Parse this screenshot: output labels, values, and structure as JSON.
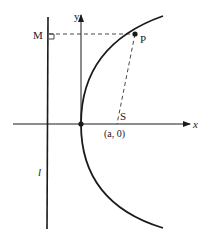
{
  "diagram": {
    "labels": {
      "y_axis": "y",
      "x_axis": "x",
      "point_M": "M",
      "point_P": "P",
      "point_S": "S",
      "focus_coords": "(a, 0)",
      "directrix": "l"
    },
    "colors": {
      "stroke": "#1a1a1a",
      "background": "#ffffff"
    }
  }
}
